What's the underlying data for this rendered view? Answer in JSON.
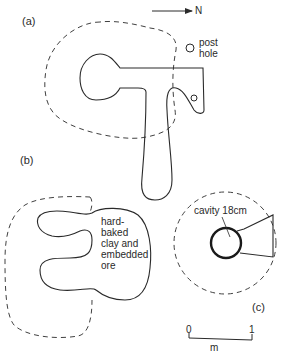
{
  "figure": {
    "north_label": "N",
    "panels": [
      {
        "id": "a",
        "label": "(a)",
        "annotation": [
          "post",
          "hole"
        ]
      },
      {
        "id": "b",
        "label": "(b)",
        "annotation": [
          "hard-",
          "baked",
          "clay and",
          "embedded",
          "ore"
        ]
      },
      {
        "id": "c",
        "label": "(c)",
        "annotation": [
          "cavity 18cm"
        ]
      }
    ],
    "scale_bar": {
      "start": "0",
      "end": "1",
      "unit": "m"
    },
    "colors": {
      "ink": "#2a2a2a",
      "background": "#ffffff"
    }
  }
}
